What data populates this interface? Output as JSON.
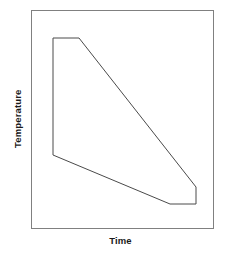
{
  "figure": {
    "background_color": "#ffffff",
    "line_color": "#4a4a4a",
    "text_color": "#1a1a1a"
  },
  "labels": {
    "y_axis": "Temperature",
    "x_axis": "Time"
  },
  "chart_data": {
    "type": "line",
    "title": "",
    "xlabel": "Time",
    "ylabel": "Temperature",
    "grid": false,
    "legend": "none",
    "axis_ticks": {
      "x": [],
      "y": []
    },
    "frame": {
      "x_min_px": 31,
      "y_min_px": 10,
      "x_max_px": 213,
      "y_max_px": 228
    },
    "series": [
      {
        "name": "processing-window-boundary",
        "closed": true,
        "points_px": [
          [
            53,
            38
          ],
          [
            79,
            38
          ],
          [
            196,
            187
          ],
          [
            196,
            204
          ],
          [
            170,
            204
          ],
          [
            53,
            155
          ]
        ],
        "points_normalized": [
          [
            0.121,
            0.872
          ],
          [
            0.264,
            0.872
          ],
          [
            0.907,
            0.188
          ],
          [
            0.907,
            0.11
          ],
          [
            0.764,
            0.11
          ],
          [
            0.121,
            0.335
          ]
        ]
      }
    ],
    "xlim": [
      0,
      1
    ],
    "ylim": [
      0,
      1
    ]
  }
}
